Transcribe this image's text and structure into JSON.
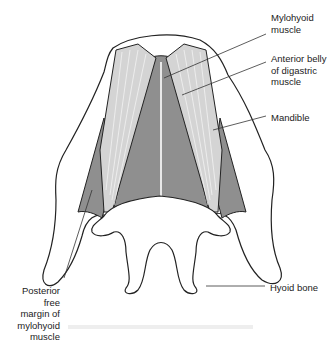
{
  "figure": {
    "colors": {
      "outline": "#222222",
      "mylohyoid_fill": "#8f8f8f",
      "digastric_fill": "#d4d4d4",
      "raphe": "#e8e8e8",
      "bone": "#ffffff"
    }
  },
  "labels": {
    "mylohyoid": "Mylohyoid\nmuscle",
    "anterior_belly": "Anterior belly\nof digastric\nmuscle",
    "mandible": "Mandible",
    "posterior_margin": "Posterior free\nmargin of\nmylohyoid\nmuscle",
    "hyoid": "Hyoid bone"
  }
}
